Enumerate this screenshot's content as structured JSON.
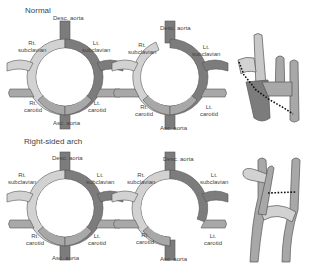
{
  "sections": [
    {
      "title": "Normal",
      "panels": [
        {
          "labels": {
            "top": "Desc. aorta",
            "top_left_1": "Rt.",
            "top_left_2": "subclavian",
            "top_right_1": "Lt.",
            "top_right_2": "subclavian",
            "bottom_left_1": "Rt.",
            "bottom_left_2": "carotid",
            "bottom_right_1": "Lt.",
            "bottom_right_2": "carotid",
            "bottom": "Asc. aorta"
          }
        },
        {
          "labels": {
            "top": "Desc. aorta",
            "top_left_1": "Rt.",
            "top_left_2": "subclavian",
            "top_right_1": "Lt.",
            "top_right_2": "subclavian",
            "bottom_left_1": "Rt.",
            "bottom_left_2": "carotid",
            "bottom_right_1": "Lt.",
            "bottom_right_2": "carotid",
            "bottom": "Asc. aorta"
          }
        }
      ]
    },
    {
      "title": "Right-sided arch",
      "panels": [
        {
          "labels": {
            "top": "Desc. aorta",
            "top_left_1": "Rt.",
            "top_left_2": "subclavian",
            "top_right_1": "Lt.",
            "top_right_2": "subclavian",
            "bottom_left_1": "Rt.",
            "bottom_left_2": "carotid",
            "bottom_right_1": "Lt.",
            "bottom_right_2": "carotid",
            "bottom": "Asc. aorta"
          }
        },
        {
          "labels": {
            "top": "Desc. aorta",
            "top_left_1": "Rt.",
            "top_left_2": "subclavian",
            "top_right_1": "Lt.",
            "top_right_2": "subclavian",
            "bottom_left_1": "Rt.",
            "bottom_left_2": "carotid",
            "bottom_right_1": "Lt.",
            "bottom_right_2": "carotid",
            "bottom": "Asc. aorta"
          }
        }
      ]
    }
  ],
  "colors": {
    "light_segment": "#d2d2d2",
    "mid_segment": "#a8a8a8",
    "dark_segment": "#7c7c7c",
    "outline": "#555555",
    "dotted_line": "#111111"
  }
}
